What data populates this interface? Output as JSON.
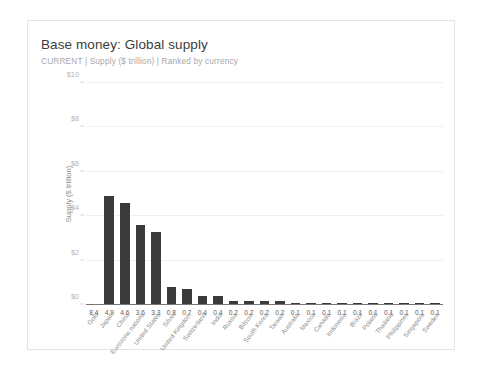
{
  "card": {
    "title": "Base money: Global supply",
    "subtitle": "CURRENT | Supply ($ trillion) | Ranked by currency"
  },
  "colors": {
    "bar": "#3b3b3b",
    "grid": "#f0f0f0",
    "axis": "#777777",
    "title_text": "#3c3c3c",
    "subtitle_text": "#a8a8a8",
    "tick_text": "#b4b4b4",
    "value_text": "#5a5a5a",
    "category_text": "#8d8d8d",
    "card_border": "#e4e4e4",
    "background": "#ffffff"
  },
  "chart_data": {
    "type": "bar",
    "title": "Base money: Global supply",
    "subtitle": "CURRENT | Supply ($ trillion) | Ranked by currency",
    "xlabel": "",
    "ylabel": "Supply ($ trillion)",
    "ylim": [
      0,
      10
    ],
    "yticks": [
      0,
      2,
      4,
      6,
      8,
      10
    ],
    "ytick_labels": [
      "$0",
      "$2",
      "$4",
      "$6",
      "$8",
      "$10"
    ],
    "grid": true,
    "legend": "none",
    "categories": [
      "Gold",
      "Japan",
      "China",
      "Eurozone nations",
      "United States",
      "Silver",
      "United Kingdom",
      "Switzerland",
      "India",
      "Russia",
      "Bitcoin",
      "South Korea",
      "Taiwan",
      "Australia",
      "Mexico",
      "Canada",
      "Indonesia",
      "Brazil",
      "Poland",
      "Thailand",
      "Philippines",
      "Singapore",
      "Sweden"
    ],
    "values": [
      8.4,
      4.9,
      4.6,
      3.6,
      3.3,
      0.8,
      0.7,
      0.4,
      0.4,
      0.2,
      0.2,
      0.2,
      0.2,
      0.1,
      0.1,
      0.1,
      0.1,
      0.1,
      0.1,
      0.1,
      0.1,
      0.1,
      0.1
    ],
    "value_labels": [
      "8.4",
      "4.9",
      "4.6",
      "3.6",
      "3.3",
      "0.8",
      "0.7",
      "0.4",
      "0.4",
      "0.2",
      "0.2",
      "0.2",
      "0.2",
      "0.1",
      "0.1",
      "0.1",
      "0.1",
      "0.1",
      "0.1",
      "0.1",
      "0.1",
      "0.1",
      "0.1"
    ],
    "clipped_bars": [
      0
    ]
  }
}
